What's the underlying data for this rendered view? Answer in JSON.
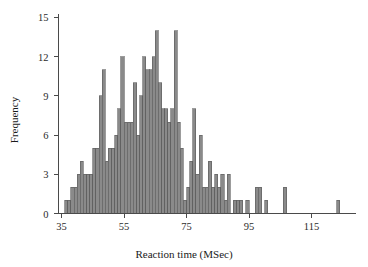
{
  "chart_data": {
    "type": "bar",
    "title": "",
    "subtitle": "",
    "xlabel": "Reaction time (MSec)",
    "ylabel": "Frequency",
    "xlim": [
      35,
      128
    ],
    "ylim": [
      0,
      15
    ],
    "xticks": [
      35,
      55,
      75,
      95,
      115
    ],
    "xtick_labels": [
      "35",
      "55",
      "75",
      "95",
      "115"
    ],
    "yticks": [
      0,
      3,
      6,
      9,
      12,
      15
    ],
    "ytick_labels": [
      "0",
      "3",
      "6",
      "9",
      "12",
      "15"
    ],
    "grid": false,
    "legend": null,
    "bin_width": 1,
    "bar_color": "#8a8a8a",
    "bar_edge_color": "#5a5a5a",
    "axis_color": "#4a4a4a",
    "categories": [
      36,
      37,
      38,
      39,
      40,
      41,
      42,
      43,
      44,
      45,
      46,
      47,
      48,
      49,
      50,
      51,
      52,
      53,
      54,
      55,
      56,
      57,
      58,
      59,
      60,
      61,
      62,
      63,
      64,
      65,
      66,
      67,
      68,
      69,
      70,
      71,
      72,
      73,
      74,
      75,
      76,
      77,
      78,
      79,
      80,
      81,
      82,
      83,
      84,
      85,
      86,
      87,
      88,
      89,
      90,
      91,
      92,
      93,
      94,
      95,
      96,
      97,
      98,
      99,
      100,
      101,
      102,
      103,
      104,
      105,
      106,
      107,
      108,
      109,
      110,
      111,
      112,
      113,
      114,
      115,
      116,
      117,
      118,
      119,
      120,
      121,
      122,
      123,
      124
    ],
    "values": [
      1,
      1,
      2,
      2,
      3,
      4,
      3,
      3,
      3,
      5,
      5,
      9,
      11,
      4,
      5,
      5,
      6,
      8,
      12,
      7,
      7,
      7,
      10,
      6,
      9,
      12,
      11,
      11,
      12,
      14,
      10,
      8,
      8,
      7,
      8,
      14,
      7,
      5,
      1,
      2,
      4,
      8,
      3,
      6,
      2,
      2,
      4,
      2,
      3,
      2,
      3,
      1,
      3,
      0,
      1,
      1,
      1,
      0,
      1,
      0,
      0,
      2,
      2,
      0,
      1,
      0,
      0,
      0,
      0,
      0,
      2,
      0,
      0,
      0,
      0,
      0,
      0,
      0,
      0,
      0,
      0,
      0,
      0,
      0,
      0,
      0,
      0,
      1,
      0
    ]
  }
}
